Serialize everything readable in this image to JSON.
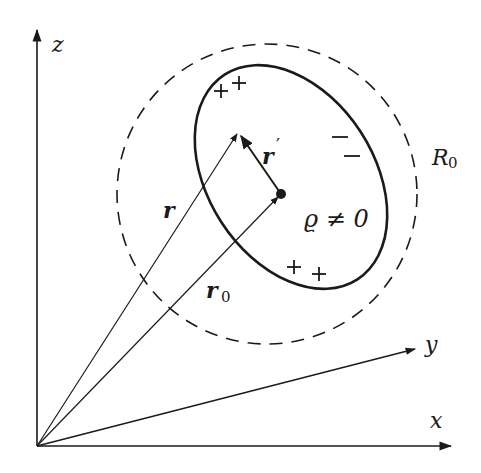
{
  "figure": {
    "axes": {
      "z_label": "z",
      "y_label": "y",
      "x_label": "x"
    },
    "vectors": {
      "r_label": "r",
      "r0_label": "r",
      "r0_subscript": "0",
      "rprime_label": "r",
      "rprime_mark": "′"
    },
    "sphere": {
      "radius_label": "R",
      "radius_subscript": "0"
    },
    "charge_region": {
      "density_label": "ϱ ≠ 0",
      "charges": [
        {
          "sign": "+",
          "position": "top-left-1"
        },
        {
          "sign": "+",
          "position": "top-left-2"
        },
        {
          "sign": "−",
          "position": "right-1"
        },
        {
          "sign": "−",
          "position": "right-2"
        },
        {
          "sign": "+",
          "position": "bottom-1"
        },
        {
          "sign": "+",
          "position": "bottom-2"
        }
      ]
    },
    "colors": {
      "ink": "#1a1a1a",
      "background": "#ffffff"
    }
  }
}
